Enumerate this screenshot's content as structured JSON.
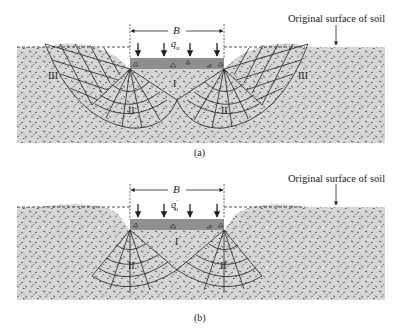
{
  "figure": {
    "panels": [
      {
        "id": "a",
        "caption": "(a)",
        "surface_label": "Original surface of soil",
        "width_label": "B",
        "load_label": "q",
        "load_subscript": "u",
        "load_prime": "",
        "zones": [
          "I",
          "II",
          "II",
          "III",
          "III"
        ]
      },
      {
        "id": "b",
        "caption": "(b)",
        "surface_label": "Original surface of soil",
        "width_label": "B",
        "load_label": "q",
        "load_subscript": "u",
        "load_prime": "′",
        "zones": [
          "I",
          "II",
          "II"
        ]
      }
    ],
    "colors": {
      "soil": "#d4d4d4",
      "speckle": "#5a5a5a",
      "footing": "#8c8c8c",
      "lines": "#222222"
    }
  }
}
